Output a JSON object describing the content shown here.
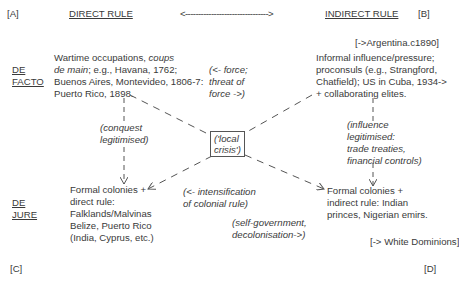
{
  "corners": {
    "a": "[A]",
    "b": "[B]",
    "c": "[C]",
    "d": "[D]"
  },
  "header": {
    "left_title": "DIRECT RULE",
    "right_title": "INDIRECT RULE",
    "arrow": "<-------------------------------->"
  },
  "row_labels": {
    "de_facto": [
      "DE",
      "FACTO"
    ],
    "de_jure": [
      "DE",
      "JURE"
    ]
  },
  "notes": {
    "argentina": "[->Argentina.c1890]",
    "white_dominions": "[-> White Dominions]"
  },
  "quadrants": {
    "top_left": {
      "lines": [
        {
          "plain": "Wartime occupations, ",
          "italic": "coups"
        },
        {
          "plain": "",
          "italic": "de main",
          "rest": "; e.g., Havana, 1762;"
        },
        {
          "plain": "Buenos Aires, Montevideo, 1806-7:"
        },
        {
          "plain": "Puerto Rico, 1898."
        }
      ]
    },
    "top_right": {
      "lines": [
        "Informal influence/pressure;",
        "proconsuls (e.g., Strangford,",
        "Chatfield); US in Cuba, 1934->",
        "+ collaborating elites."
      ]
    },
    "bottom_left": {
      "lines": [
        "Formal colonies +",
        "direct rule:",
        "Falklands/Malvinas",
        "Belize, Puerto Rico",
        "(India, Cyprus, etc.)"
      ]
    },
    "bottom_right": {
      "lines": [
        "Formal colonies +",
        "indirect rule: Indian",
        "princes, Nigerian emirs."
      ]
    }
  },
  "annotations": {
    "force": [
      "(<- force;",
      "threat of",
      "force ->)"
    ],
    "conquest": [
      "(conquest",
      "legitimised)"
    ],
    "local_crisis": [
      "('local",
      "crisis')"
    ],
    "influence": [
      "(influence",
      "legitimised:",
      "trade treaties,",
      "financial controls)"
    ],
    "intensification": [
      "(<- intensification",
      "of colonial rule)"
    ],
    "self_government": [
      "(self-government,",
      "decolonisation->)"
    ]
  },
  "colors": {
    "text": "#3a3a3a",
    "line": "#555555",
    "background": "#ffffff"
  }
}
